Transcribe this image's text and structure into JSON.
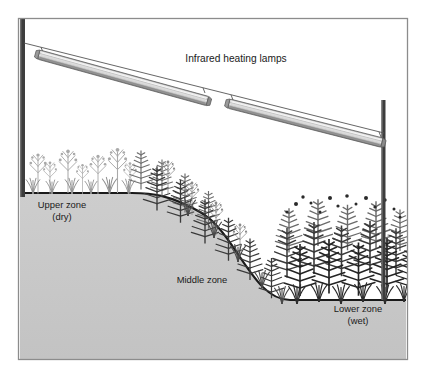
{
  "figure": {
    "name": "infrared-heating-lamp-field-experiment",
    "canvas": {
      "width": 428,
      "height": 381
    },
    "background_color": "#ffffff",
    "frame": {
      "x": 18,
      "y": 18,
      "width": 390,
      "height": 342,
      "stroke_color": "#8c8c8c",
      "fill_color": "#ffffff"
    }
  },
  "labels": {
    "lamps_title": "Infrared heating lamps",
    "upper_zone_line1": "Upper zone",
    "upper_zone_line2": "(dry)",
    "middle_zone": "Middle zone",
    "lower_zone_line1": "Lower zone",
    "lower_zone_line2": "(wet)"
  },
  "label_positions": {
    "lamps_title": {
      "x": 236,
      "y": 62
    },
    "upper_zone_line1": {
      "x": 62,
      "y": 208
    },
    "upper_zone_line2": {
      "x": 62,
      "y": 220
    },
    "middle_zone": {
      "x": 202,
      "y": 283
    },
    "lower_zone_line1": {
      "x": 358,
      "y": 312
    },
    "lower_zone_line2": {
      "x": 358,
      "y": 324
    }
  },
  "colors": {
    "frame_stroke": "#8c8c8c",
    "sky": "#ffffff",
    "soil_fill": "#c8c8c8",
    "soil_outline": "#1a1a1a",
    "post_dark": "#3d3d3d",
    "post_edge": "#6b6b6b",
    "lamp_body": "#b4b4b4",
    "lamp_highlight": "#e8e8e8",
    "lamp_shadow": "#7d7d7d",
    "lamp_outline": "#5a5a5a",
    "cable": "#555555",
    "veg_light": "#b0b0b0",
    "veg_mid": "#7a7a7a",
    "veg_dark": "#3a3a3a",
    "veg_darkest": "#242424",
    "text": "#1a1a1a"
  },
  "ground_profile": {
    "description": "flat upper terrace, S-curve descent, flat lower terrace",
    "upper_terrace_y": 193,
    "shoulder_x": 132,
    "toe_x": 290,
    "lower_terrace_y": 298,
    "left_x": 20,
    "right_x": 406
  },
  "posts": [
    {
      "name": "left-support-post",
      "x": 22.5,
      "top_y": 19,
      "bottom_y": 196,
      "width": 5,
      "color": "#3d3d3d"
    },
    {
      "name": "right-support-post",
      "x": 383.5,
      "top_y": 100,
      "bottom_y": 300,
      "width": 4,
      "color": "#3d3d3d"
    }
  ],
  "cable": {
    "name": "suspension-cable",
    "start": {
      "x": 25,
      "y": 44
    },
    "end": {
      "x": 383,
      "y": 133
    },
    "color": "#555555"
  },
  "lamps": [
    {
      "name": "infrared-lamp-left",
      "start": {
        "x": 38,
        "y": 48
      },
      "end": {
        "x": 208,
        "y": 95
      },
      "thickness": 9
    },
    {
      "name": "infrared-lamp-right",
      "start": {
        "x": 228,
        "y": 97
      },
      "end": {
        "x": 382,
        "y": 136
      },
      "thickness": 9
    }
  ],
  "vegetation_zones": [
    {
      "name": "upper-zone-vegetation",
      "zone": "upper",
      "moisture": "dry",
      "density": "sparse",
      "tone": "light",
      "description": "sparse light-gray forbs and grasses on dry upper terrace"
    },
    {
      "name": "middle-zone-vegetation",
      "zone": "middle",
      "moisture": "intermediate",
      "density": "moderate",
      "tone": "medium-dark",
      "description": "medium-density dark fern fronds along the sloping bank"
    },
    {
      "name": "lower-zone-vegetation",
      "zone": "lower",
      "moisture": "wet",
      "density": "dense",
      "tone": "dark",
      "description": "dense dark fern canopy on the wet lower terrace"
    }
  ]
}
